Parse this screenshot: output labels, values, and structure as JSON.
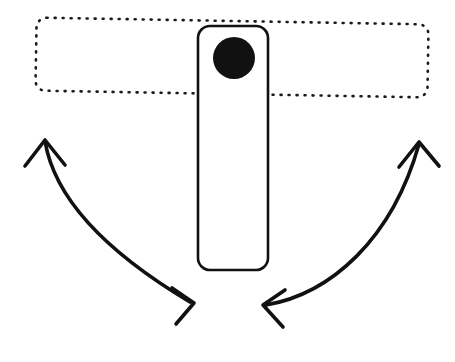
{
  "figure": {
    "title": "Mechanical linkage motion diagram",
    "background_color": "#ffffff",
    "stroke_color": "#111111",
    "fill_color": "#111111",
    "width": 455,
    "height": 362,
    "caption": ""
  },
  "shapes": {
    "dotted_bar": {
      "name": "horizontal-dotted-bar",
      "style": "dotted-outline",
      "stroke_color": "#1a1a1a",
      "fill": "none",
      "dash_pattern": "1 7",
      "stroke_width": 2.6,
      "corner_radius": 10,
      "x": 36,
      "y": 21,
      "width": 392,
      "height": 73,
      "rotation_deg": 1.0,
      "label": ""
    },
    "vertical_bar": {
      "name": "vertical-solid-bar",
      "style": "solid-outline",
      "stroke_color": "#111111",
      "fill": "#ffffff",
      "stroke_width": 2.6,
      "corner_radius": 12,
      "x": 198,
      "y": 26,
      "width": 70,
      "height": 244,
      "label": ""
    },
    "pivot_dot": {
      "name": "pivot-dot",
      "style": "filled-circle",
      "fill_color": "#111111",
      "cx": 234,
      "cy": 58,
      "r": 21,
      "label": ""
    }
  },
  "arrows": {
    "left": {
      "name": "left-rotation-arrow",
      "description": "curved arrow from lower-right sweeping up to the left, arrowheads at both ends",
      "stroke_color": "#111111",
      "stroke_width": 3.6,
      "path": "M 45 141 C 52 184 86 240 190 302",
      "head_start": {
        "tip_x": 45,
        "tip_y": 141,
        "direction": "up"
      },
      "head_end": {
        "tip_x": 191,
        "tip_y": 303,
        "direction": "right"
      },
      "label": ""
    },
    "right": {
      "name": "right-rotation-arrow",
      "description": "curved arrow from lower-left sweeping up to the right, arrowheads at both ends",
      "stroke_color": "#111111",
      "stroke_width": 3.6,
      "path": "M 266 305 C 330 294 392 240 419 144",
      "head_start": {
        "tip_x": 265,
        "tip_y": 305,
        "direction": "left"
      },
      "head_end": {
        "tip_x": 419,
        "tip_y": 143,
        "direction": "up"
      },
      "label": ""
    }
  }
}
